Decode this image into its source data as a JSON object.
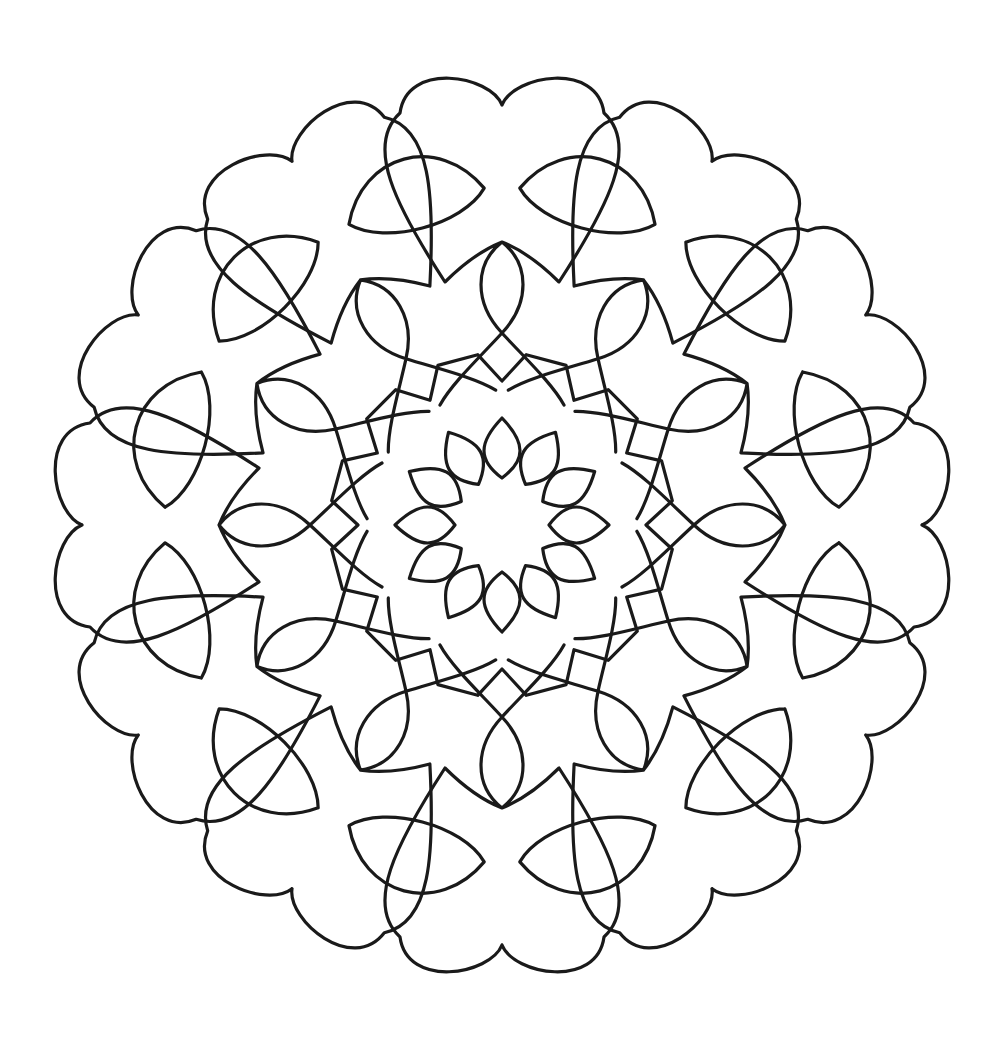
{
  "image": {
    "subject": "Mandala coloring page",
    "background_color": "#ffffff",
    "line_color": "#1a1a1a"
  },
  "mandala": {
    "center": [
      502,
      525
    ],
    "symmetry": 12,
    "stroke_width": 3.2,
    "outer_hearts": {
      "count": 12,
      "notch_radius": 420,
      "lobe_outer_radius": 458,
      "lobe_offset_x": 55,
      "side_half_width": 112,
      "crossing_radius_outer": 283,
      "crossing_radius_inner": 192,
      "vesica_half_width": 24
    },
    "inner_ring": {
      "v_point_radius": 144,
      "corner_radius": 172
    },
    "center_flower": {
      "petals": 12,
      "inner_radius": 47,
      "tip_radius": 107,
      "petal_half_width": 24
    }
  }
}
